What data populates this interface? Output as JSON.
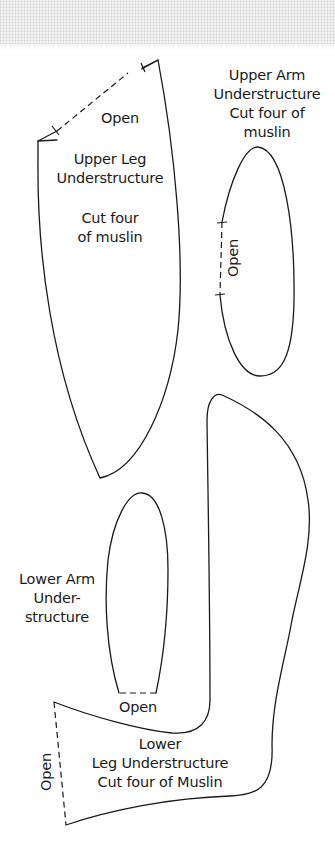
{
  "pieces": {
    "upper_leg": {
      "open_label": "Open",
      "title_line1": "Upper Leg",
      "title_line2": "Understructure",
      "cut_line1": "Cut four",
      "cut_line2": "of muslin"
    },
    "upper_arm": {
      "title_line1": "Upper Arm",
      "title_line2": "Understructure",
      "cut_line1": "Cut four of",
      "cut_line2": "muslin",
      "open_label": "Open"
    },
    "lower_arm": {
      "title_line1": "Lower Arm",
      "title_line2": "Under-",
      "title_line3": "structure",
      "open_label": "Open"
    },
    "lower_leg": {
      "title_line1": "Lower",
      "title_line2": "Leg Understructure",
      "cut_line": "Cut four of Muslin",
      "open_label": "Open"
    }
  },
  "colors": {
    "line": "#1a1a1a",
    "background": "#ffffff",
    "fabric_texture": "#f3f3f3"
  }
}
